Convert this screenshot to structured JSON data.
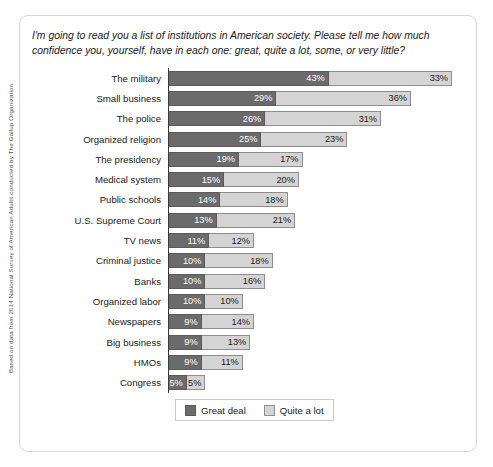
{
  "chart_data": {
    "type": "bar",
    "orientation": "horizontal",
    "stacked": true,
    "title": "I'm going to read you a list of institutions in American society. Please tell me how much confidence you, yourself, have in each one: great, quite a lot, some, or very little?",
    "xlabel": "",
    "ylabel": "",
    "grid": false,
    "legend_position": "bottom",
    "value_suffix": "%",
    "xlim": [
      0,
      80
    ],
    "categories": [
      "The military",
      "Small business",
      "The police",
      "Organized religion",
      "The presidency",
      "Medical system",
      "Public schools",
      "U.S. Supreme Court",
      "TV news",
      "Criminal justice",
      "Banks",
      "Organized labor",
      "Newspapers",
      "Big business",
      "HMOs",
      "Congress"
    ],
    "series": [
      {
        "name": "Great deal",
        "color": "#6b6b6b",
        "values": [
          43,
          29,
          26,
          25,
          19,
          15,
          14,
          13,
          11,
          10,
          10,
          10,
          9,
          9,
          9,
          5
        ],
        "labels": [
          "43%",
          "29%",
          "26%",
          "25%",
          "19%",
          "15%",
          "14%",
          "13%",
          "11%",
          "10%",
          "10%",
          "10%",
          "9%",
          "9%",
          "9%",
          "5%"
        ]
      },
      {
        "name": "Quite a lot",
        "color": "#d4d4d4",
        "values": [
          33,
          36,
          31,
          23,
          17,
          20,
          18,
          21,
          12,
          18,
          16,
          10,
          14,
          13,
          11,
          5
        ],
        "labels": [
          "33%",
          "36%",
          "31%",
          "23%",
          "17%",
          "20%",
          "18%",
          "21%",
          "12%",
          "18%",
          "16%",
          "10%",
          "14%",
          "13%",
          "11%",
          "5%"
        ]
      }
    ]
  },
  "legend": {
    "items": [
      {
        "label": "Great deal"
      },
      {
        "label": "Quite a lot"
      }
    ]
  },
  "source_note": "Based on data from 2014 National Survey of American Adults conducted by The Gallup Organization."
}
